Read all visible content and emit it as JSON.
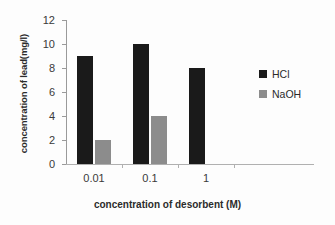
{
  "chart_data": {
    "type": "bar",
    "title": "",
    "xlabel": "concentration of desorbent (M)",
    "ylabel": "concentration of lead(mg/l)",
    "categories": [
      "0.01",
      "0.1",
      "1"
    ],
    "series": [
      {
        "name": "HCl",
        "color": "#1a1a1a",
        "values": [
          9,
          10,
          8
        ]
      },
      {
        "name": "NaOH",
        "color": "#8c8c8c",
        "values": [
          2,
          4,
          0
        ]
      }
    ],
    "ylim": [
      0,
      12
    ],
    "ytick_labels": [
      "0",
      "2",
      "4",
      "6",
      "8",
      "10",
      "12"
    ],
    "ytick_values": [
      0,
      2,
      4,
      6,
      8,
      10,
      12
    ],
    "grid": false,
    "legend_position": "right",
    "legend_entries": [
      "HCl",
      "NaOH"
    ]
  }
}
